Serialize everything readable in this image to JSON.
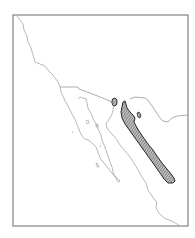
{
  "map": {
    "type": "species-range-map",
    "region": "Northwestern Mexico / Baja California / US border",
    "frame": {
      "x": 13,
      "y": 15,
      "width": 175,
      "height": 211
    },
    "colors": {
      "background": "#ffffff",
      "frame": "#6b6b6b",
      "coastline": "#9a9a9a",
      "border": "#8a8a8a",
      "range_fill": "#a8a8a8",
      "range_stroke": "#2a2a2a",
      "hatch": "#555555"
    },
    "features": [
      {
        "name": "pacific-coastline",
        "kind": "coastline"
      },
      {
        "name": "us-mexico-border",
        "kind": "political-border"
      },
      {
        "name": "baja-peninsula-gulf-coast",
        "kind": "coastline"
      },
      {
        "name": "mainland-gulf-coast",
        "kind": "coastline"
      },
      {
        "name": "main-range",
        "kind": "distribution-area",
        "pattern": "hatched"
      },
      {
        "name": "small-range-north",
        "kind": "distribution-area",
        "pattern": "hatched"
      },
      {
        "name": "small-range-east",
        "kind": "distribution-area",
        "pattern": "hatched"
      }
    ]
  }
}
